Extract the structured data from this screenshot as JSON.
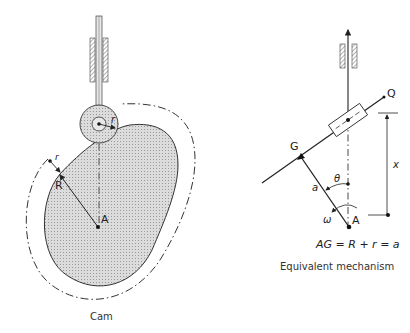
{
  "figure": {
    "left_panel": {
      "caption": "Cam",
      "labels": {
        "roller_radius": "r",
        "offset_r": "r",
        "base_radius": "R",
        "center": "A"
      }
    },
    "right_panel": {
      "caption": "Equivalent mechanism",
      "equation": "AG = R + r = a",
      "labels": {
        "Q": "Q",
        "G": "G",
        "a": "a",
        "theta": "θ",
        "omega": "ω",
        "A": "A",
        "x": "x"
      }
    },
    "colors": {
      "ink": "#222222",
      "cam_fill": "#cfcfcf",
      "roller_fill": "#d6d6d6",
      "hatch": "#555555"
    }
  }
}
